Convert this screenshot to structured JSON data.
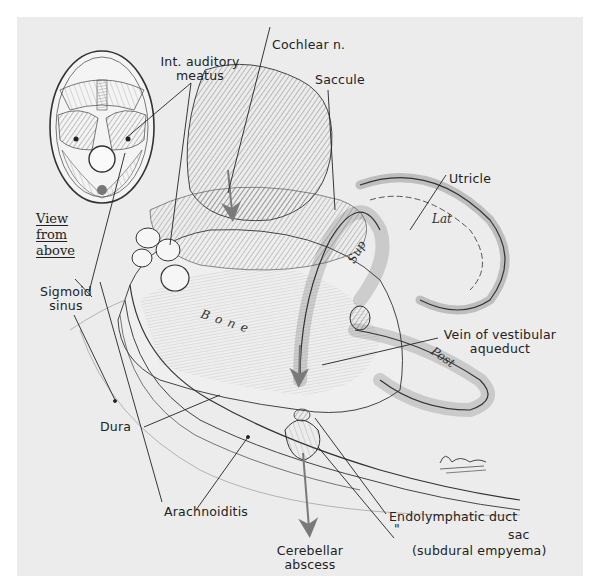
{
  "figure": {
    "background": "#ececec",
    "ink_color": "#222222",
    "arrow_color": "#7a7a7a",
    "inset": {
      "caption_lines": [
        "View",
        "from",
        "above"
      ],
      "subject": "skull-base-view-from-above"
    },
    "labels": {
      "cochlear_n": "Cochlear n.",
      "int_auditory_meatus_line1": "Int. auditory",
      "int_auditory_meatus_line2": "meatus",
      "saccule": "Saccule",
      "utricle": "Utricle",
      "lat": "Lat",
      "sup": "Sup",
      "post": "Post",
      "bone": "Bone",
      "sigmoid_sinus_line1": "Sigmoid",
      "sigmoid_sinus_line2": "sinus",
      "vein_line1": "Vein of vestibular",
      "vein_line2": "aqueduct",
      "dura": "Dura",
      "arachnoiditis": "Arachnoiditis",
      "endolymphatic_line1": "Endolymphatic duct",
      "endolymphatic_ditto": "\"",
      "endolymphatic_line2": "sac",
      "endolymphatic_line3": "(subdural empyema)",
      "cerebellar_line1": "Cerebellar",
      "cerebellar_line2": "abscess"
    },
    "signature": "Bellombo"
  }
}
